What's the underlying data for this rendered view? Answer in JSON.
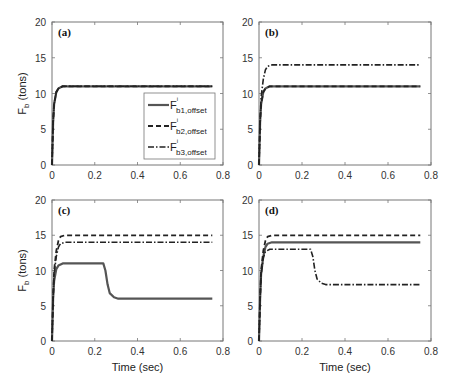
{
  "figure": {
    "ylabel_main": "F",
    "ylabel_sub": "b",
    "ylabel_unit": " (tons)",
    "xlabel": "Time (sec)"
  },
  "legend": {
    "entries": [
      {
        "base": "F",
        "sup": "i",
        "sub": "b1,offset",
        "style": "solid"
      },
      {
        "base": "F",
        "sup": "i",
        "sub": "b2,offset",
        "style": "dashed"
      },
      {
        "base": "F",
        "sup": "i",
        "sub": "b3,offset",
        "style": "dashdot"
      }
    ]
  },
  "chart_data": [
    {
      "type": "line",
      "panel": "(a)",
      "xlabel": "",
      "ylabel": "F_b (tons)",
      "xlim": [
        0,
        0.8
      ],
      "ylim": [
        0,
        20
      ],
      "xticks": [
        0,
        0.2,
        0.4,
        0.6,
        0.8
      ],
      "yticks": [
        0,
        5,
        10,
        15,
        20
      ],
      "grid": false,
      "legend_position": "lower right",
      "series": [
        {
          "name": "F^i_b1,offset",
          "style": "solid",
          "x": [
            0,
            0.005,
            0.01,
            0.02,
            0.03,
            0.05,
            0.07,
            0.75
          ],
          "y": [
            0,
            6,
            8.5,
            10.2,
            10.7,
            11,
            11,
            11
          ]
        },
        {
          "name": "F^i_b2,offset",
          "style": "dashed",
          "x": [
            0,
            0.005,
            0.01,
            0.02,
            0.03,
            0.05,
            0.07,
            0.75
          ],
          "y": [
            0,
            6,
            8.5,
            10.2,
            10.7,
            11,
            11,
            11
          ]
        },
        {
          "name": "F^i_b3,offset",
          "style": "dashdot",
          "x": [
            0,
            0.005,
            0.01,
            0.02,
            0.03,
            0.05,
            0.07,
            0.75
          ],
          "y": [
            0,
            6,
            8.5,
            10.2,
            10.7,
            11,
            11,
            11
          ]
        }
      ]
    },
    {
      "type": "line",
      "panel": "(b)",
      "xlabel": "",
      "ylabel": "",
      "xlim": [
        0,
        0.8
      ],
      "ylim": [
        0,
        20
      ],
      "xticks": [
        0,
        0.2,
        0.4,
        0.6,
        0.8
      ],
      "yticks": [
        0,
        5,
        10,
        15,
        20
      ],
      "grid": false,
      "series": [
        {
          "name": "F^i_b1,offset",
          "style": "solid",
          "x": [
            0,
            0.005,
            0.01,
            0.02,
            0.03,
            0.05,
            0.07,
            0.75
          ],
          "y": [
            0,
            6,
            8.5,
            10.2,
            10.7,
            11,
            11,
            11
          ]
        },
        {
          "name": "F^i_b2,offset",
          "style": "dashed",
          "x": [
            0,
            0.005,
            0.01,
            0.02,
            0.03,
            0.05,
            0.07,
            0.75
          ],
          "y": [
            0,
            6,
            8.5,
            10.2,
            10.7,
            11,
            11,
            11
          ]
        },
        {
          "name": "F^i_b3,offset",
          "style": "dashdot",
          "x": [
            0,
            0.005,
            0.01,
            0.02,
            0.03,
            0.04,
            0.06,
            0.75
          ],
          "y": [
            0,
            6,
            9.5,
            12,
            13.3,
            13.8,
            14,
            14
          ]
        }
      ]
    },
    {
      "type": "line",
      "panel": "(c)",
      "xlabel": "Time (sec)",
      "ylabel": "F_b (tons)",
      "xlim": [
        0,
        0.8
      ],
      "ylim": [
        0,
        20
      ],
      "xticks": [
        0,
        0.2,
        0.4,
        0.6,
        0.8
      ],
      "yticks": [
        0,
        5,
        10,
        15,
        20
      ],
      "grid": false,
      "series": [
        {
          "name": "F^i_b1,offset",
          "style": "solid",
          "x": [
            0,
            0.005,
            0.01,
            0.02,
            0.03,
            0.05,
            0.07,
            0.24,
            0.25,
            0.26,
            0.27,
            0.29,
            0.31,
            0.75
          ],
          "y": [
            0,
            6,
            8.5,
            10.2,
            10.7,
            11,
            11,
            11,
            10,
            8,
            6.8,
            6.2,
            6,
            6
          ]
        },
        {
          "name": "F^i_b2,offset",
          "style": "dashed",
          "x": [
            0,
            0.005,
            0.01,
            0.02,
            0.03,
            0.04,
            0.06,
            0.75
          ],
          "y": [
            0,
            6,
            10,
            12.8,
            14.2,
            14.8,
            15,
            15
          ]
        },
        {
          "name": "F^i_b3,offset",
          "style": "dashdot",
          "x": [
            0,
            0.005,
            0.01,
            0.02,
            0.03,
            0.04,
            0.06,
            0.75
          ],
          "y": [
            0,
            6,
            9.5,
            12,
            13.3,
            13.8,
            14,
            14
          ]
        }
      ]
    },
    {
      "type": "line",
      "panel": "(d)",
      "xlabel": "Time (sec)",
      "ylabel": "",
      "xlim": [
        0,
        0.8
      ],
      "ylim": [
        0,
        20
      ],
      "xticks": [
        0,
        0.2,
        0.4,
        0.6,
        0.8
      ],
      "yticks": [
        0,
        5,
        10,
        15,
        20
      ],
      "grid": false,
      "series": [
        {
          "name": "F^i_b1,offset",
          "style": "solid",
          "x": [
            0,
            0.005,
            0.01,
            0.02,
            0.03,
            0.04,
            0.06,
            0.75
          ],
          "y": [
            0,
            6,
            9.5,
            12,
            13.3,
            13.8,
            14,
            14
          ]
        },
        {
          "name": "F^i_b2,offset",
          "style": "dashed",
          "x": [
            0,
            0.005,
            0.01,
            0.02,
            0.03,
            0.04,
            0.06,
            0.75
          ],
          "y": [
            0,
            6,
            10,
            12.8,
            14.2,
            14.8,
            15,
            15
          ]
        },
        {
          "name": "F^i_b3,offset",
          "style": "dashdot",
          "x": [
            0,
            0.005,
            0.01,
            0.02,
            0.03,
            0.05,
            0.07,
            0.24,
            0.25,
            0.26,
            0.27,
            0.29,
            0.31,
            0.75
          ],
          "y": [
            0,
            6,
            9.3,
            11.8,
            12.7,
            13,
            13,
            13,
            12,
            10,
            8.8,
            8.2,
            8,
            8
          ]
        }
      ]
    }
  ]
}
